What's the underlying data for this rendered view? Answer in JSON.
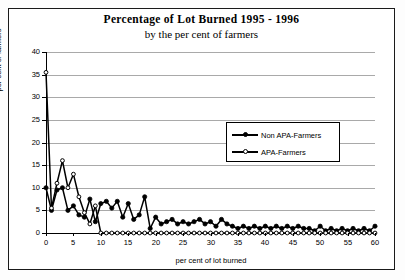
{
  "title": "Percentage of Lot Burned 1995 - 1996",
  "subtitle": "by the per cent of farmers",
  "legend": {
    "entries": [
      {
        "label": "Non APA-Farmers",
        "marker": "filled-circle",
        "color": "#000000"
      },
      {
        "label": "APA-Farmers",
        "marker": "open-circle",
        "color": "#000000"
      }
    ]
  },
  "axes": {
    "y_label": "per cent of farmers",
    "x_label": "per cent of lot burned",
    "y_ticks": [
      "0",
      "5",
      "10",
      "15",
      "20",
      "25",
      "30",
      "35",
      "40"
    ],
    "x_ticks": [
      "0",
      "5",
      "10",
      "15",
      "20",
      "25",
      "30",
      "35",
      "40",
      "45",
      "50",
      "55",
      "60"
    ]
  },
  "chart_data": {
    "type": "line",
    "title": "Percentage of Lot Burned 1995 - 1996",
    "subtitle": "by the per cent of farmers",
    "xlabel": "per cent of lot burned",
    "ylabel": "per cent of farmers",
    "xlim": [
      0,
      60
    ],
    "ylim": [
      0,
      40
    ],
    "xtick_step": 5,
    "ytick_step": 5,
    "grid": "horizontal",
    "legend_position": "inside-right",
    "x": [
      0,
      1,
      2,
      3,
      4,
      5,
      6,
      7,
      8,
      9,
      10,
      11,
      12,
      13,
      14,
      15,
      16,
      17,
      18,
      19,
      20,
      21,
      22,
      23,
      24,
      25,
      26,
      27,
      28,
      29,
      30,
      31,
      32,
      33,
      34,
      35,
      36,
      37,
      38,
      39,
      40,
      41,
      42,
      43,
      44,
      45,
      46,
      47,
      48,
      49,
      50,
      51,
      52,
      53,
      54,
      55,
      56,
      57,
      58,
      59,
      60
    ],
    "series": [
      {
        "name": "Non APA-Farmers",
        "marker": "filled-circle",
        "color": "#000000",
        "values": [
          10,
          5,
          9.5,
          10,
          5,
          6,
          4,
          3.5,
          7.5,
          2.5,
          6.5,
          7,
          5.5,
          7,
          3.5,
          6.5,
          3,
          4,
          8,
          1,
          3.5,
          2,
          2.5,
          3,
          2,
          2.5,
          2,
          2.5,
          3,
          2,
          2.5,
          1.5,
          3,
          2,
          1.5,
          1,
          1.5,
          1,
          1.5,
          1,
          1.5,
          1,
          1.5,
          1,
          1.5,
          1,
          1.5,
          1,
          1,
          0.5,
          1.5,
          0.5,
          1,
          0.5,
          1,
          0.5,
          1,
          0.5,
          1,
          0.5,
          1.5
        ]
      },
      {
        "name": "APA-Farmers",
        "marker": "open-circle",
        "color": "#000000",
        "values": [
          35.5,
          5.5,
          11,
          16,
          10,
          13,
          8,
          4.5,
          2,
          6,
          0,
          0,
          0,
          0,
          0,
          0,
          0,
          0,
          0,
          0,
          0,
          0,
          0,
          0,
          0,
          0,
          0,
          0,
          0,
          0,
          0,
          0,
          0,
          0,
          0,
          0,
          0,
          0,
          0,
          0,
          0,
          0,
          0,
          0,
          0,
          0,
          0,
          0,
          0,
          0,
          0,
          0,
          0,
          0,
          0,
          0,
          0,
          0,
          0,
          0,
          0
        ]
      }
    ]
  }
}
